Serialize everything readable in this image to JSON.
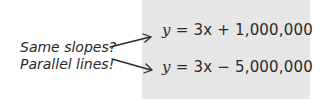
{
  "equations": [
    {
      "var": "y",
      "rest": " = 3x + 1,000,000"
    },
    {
      "var": "y",
      "rest": " = 3x − 5,000,000"
    }
  ],
  "annotations": [
    {
      "text": "Same slopes?"
    },
    {
      "text": "Parallel lines!"
    }
  ],
  "colors": {
    "box": "#e6e6e6",
    "text": "#2a2a2a"
  }
}
